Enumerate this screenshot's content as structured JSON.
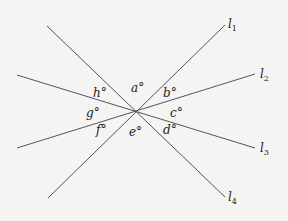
{
  "diagram": {
    "type": "intersecting-lines",
    "center": [
      136,
      111
    ],
    "lines": [
      {
        "id": "l1",
        "label": "l",
        "sub": "1",
        "from": [
          48,
          198
        ],
        "to": [
          225,
          25
        ],
        "label_pos": [
          228,
          28
        ]
      },
      {
        "id": "l2",
        "label": "l",
        "sub": "2",
        "from": [
          17,
          148
        ],
        "to": [
          255,
          74
        ],
        "label_pos": [
          260,
          78
        ]
      },
      {
        "id": "l3",
        "label": "l",
        "sub": "3",
        "from": [
          17,
          75
        ],
        "to": [
          255,
          148
        ],
        "label_pos": [
          260,
          152
        ]
      },
      {
        "id": "l4",
        "label": "l",
        "sub": "4",
        "from": [
          47,
          26
        ],
        "to": [
          225,
          197
        ],
        "label_pos": [
          228,
          201
        ]
      }
    ],
    "angles": [
      {
        "name": "a",
        "text": "a°",
        "pos": [
          131,
          92
        ]
      },
      {
        "name": "b",
        "text": "b°",
        "pos": [
          165,
          95
        ]
      },
      {
        "name": "c",
        "text": "c°",
        "pos": [
          170,
          118
        ]
      },
      {
        "name": "d",
        "text": "d°",
        "pos": [
          164,
          136
        ]
      },
      {
        "name": "e",
        "text": "e°",
        "pos": [
          130,
          138
        ]
      },
      {
        "name": "f",
        "text": "f°",
        "pos": [
          96,
          135
        ]
      },
      {
        "name": "g",
        "text": "g°",
        "pos": [
          86,
          117
        ]
      },
      {
        "name": "h",
        "text": "h°",
        "pos": [
          93,
          95
        ]
      }
    ]
  }
}
